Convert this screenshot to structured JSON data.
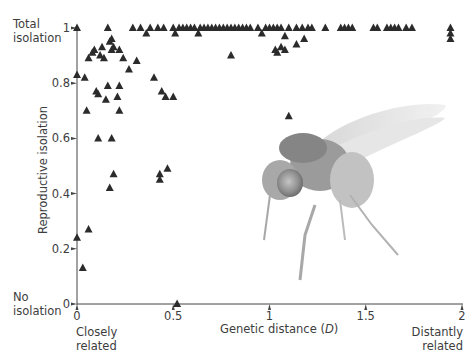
{
  "chart_data": {
    "type": "scatter",
    "title": "",
    "xlabel": "Genetic distance (D)",
    "ylabel": "Reproductive isolation",
    "xlim": [
      0,
      2
    ],
    "ylim": [
      0,
      1
    ],
    "x_ticks": [
      "0",
      "0.5",
      "1",
      "1.5",
      "2"
    ],
    "y_ticks": [
      "0",
      "0.2",
      "0.4",
      "0.6",
      "0.8",
      "1"
    ],
    "grid": false,
    "legend": null,
    "marker": "triangle",
    "marker_color": "#2b2b2b",
    "annotations": {
      "y_top": "Total isolation",
      "y_bottom": "No isolation",
      "x_left": "Closely related",
      "x_right": "Distantly related"
    },
    "points": [
      {
        "x": 0.0,
        "y": 1.0
      },
      {
        "x": 0.0,
        "y": 0.83
      },
      {
        "x": 0.04,
        "y": 0.82
      },
      {
        "x": 0.0,
        "y": 0.24
      },
      {
        "x": 0.03,
        "y": 0.13
      },
      {
        "x": 0.06,
        "y": 0.27
      },
      {
        "x": 0.16,
        "y": 1.0
      },
      {
        "x": 0.29,
        "y": 1.0
      },
      {
        "x": 0.33,
        "y": 1.0
      },
      {
        "x": 0.36,
        "y": 0.98
      },
      {
        "x": 0.06,
        "y": 0.89
      },
      {
        "x": 0.08,
        "y": 0.91
      },
      {
        "x": 0.09,
        "y": 0.92
      },
      {
        "x": 0.12,
        "y": 0.9
      },
      {
        "x": 0.13,
        "y": 0.93
      },
      {
        "x": 0.14,
        "y": 0.89
      },
      {
        "x": 0.17,
        "y": 0.95
      },
      {
        "x": 0.18,
        "y": 0.96
      },
      {
        "x": 0.18,
        "y": 0.92
      },
      {
        "x": 0.19,
        "y": 0.93
      },
      {
        "x": 0.22,
        "y": 0.92
      },
      {
        "x": 0.24,
        "y": 0.89
      },
      {
        "x": 0.31,
        "y": 0.88
      },
      {
        "x": 0.27,
        "y": 0.85
      },
      {
        "x": 0.1,
        "y": 0.77
      },
      {
        "x": 0.11,
        "y": 0.76
      },
      {
        "x": 0.16,
        "y": 0.79
      },
      {
        "x": 0.15,
        "y": 0.74
      },
      {
        "x": 0.21,
        "y": 0.75
      },
      {
        "x": 0.22,
        "y": 0.79
      },
      {
        "x": 0.05,
        "y": 0.7
      },
      {
        "x": 0.22,
        "y": 0.7
      },
      {
        "x": 0.11,
        "y": 0.6
      },
      {
        "x": 0.18,
        "y": 0.6
      },
      {
        "x": 0.19,
        "y": 0.47
      },
      {
        "x": 0.17,
        "y": 0.42
      },
      {
        "x": 0.4,
        "y": 0.82
      },
      {
        "x": 0.44,
        "y": 0.77
      },
      {
        "x": 0.46,
        "y": 0.75
      },
      {
        "x": 0.5,
        "y": 0.75
      },
      {
        "x": 0.43,
        "y": 0.47
      },
      {
        "x": 0.43,
        "y": 0.45
      },
      {
        "x": 0.47,
        "y": 0.49
      },
      {
        "x": 0.52,
        "y": 0.0
      },
      {
        "x": 0.38,
        "y": 1.0
      },
      {
        "x": 0.42,
        "y": 1.0
      },
      {
        "x": 0.45,
        "y": 1.0
      },
      {
        "x": 0.5,
        "y": 1.0
      },
      {
        "x": 0.51,
        "y": 0.98
      },
      {
        "x": 0.53,
        "y": 1.0
      },
      {
        "x": 0.55,
        "y": 1.0
      },
      {
        "x": 0.57,
        "y": 1.0
      },
      {
        "x": 0.59,
        "y": 1.0
      },
      {
        "x": 0.61,
        "y": 1.0
      },
      {
        "x": 0.63,
        "y": 0.98
      },
      {
        "x": 0.64,
        "y": 1.0
      },
      {
        "x": 0.66,
        "y": 1.0
      },
      {
        "x": 0.68,
        "y": 1.0
      },
      {
        "x": 0.7,
        "y": 1.0
      },
      {
        "x": 0.72,
        "y": 1.0
      },
      {
        "x": 0.74,
        "y": 1.0
      },
      {
        "x": 0.76,
        "y": 1.0
      },
      {
        "x": 0.78,
        "y": 1.0
      },
      {
        "x": 0.8,
        "y": 1.0
      },
      {
        "x": 0.82,
        "y": 1.0
      },
      {
        "x": 0.84,
        "y": 1.0
      },
      {
        "x": 0.86,
        "y": 1.0
      },
      {
        "x": 0.88,
        "y": 1.0
      },
      {
        "x": 0.9,
        "y": 1.0
      },
      {
        "x": 0.8,
        "y": 0.9
      },
      {
        "x": 0.94,
        "y": 1.0
      },
      {
        "x": 0.96,
        "y": 0.98
      },
      {
        "x": 0.98,
        "y": 1.0
      },
      {
        "x": 1.0,
        "y": 1.0
      },
      {
        "x": 1.02,
        "y": 1.0
      },
      {
        "x": 1.04,
        "y": 1.0
      },
      {
        "x": 1.06,
        "y": 1.0
      },
      {
        "x": 1.08,
        "y": 0.97
      },
      {
        "x": 1.1,
        "y": 1.0
      },
      {
        "x": 1.14,
        "y": 1.0
      },
      {
        "x": 1.17,
        "y": 1.0
      },
      {
        "x": 1.2,
        "y": 1.0
      },
      {
        "x": 1.22,
        "y": 1.0
      },
      {
        "x": 1.29,
        "y": 1.0
      },
      {
        "x": 1.18,
        "y": 0.96
      },
      {
        "x": 1.14,
        "y": 0.94
      },
      {
        "x": 1.06,
        "y": 0.93
      },
      {
        "x": 1.08,
        "y": 0.92
      },
      {
        "x": 1.04,
        "y": 0.91
      },
      {
        "x": 1.03,
        "y": 0.92
      },
      {
        "x": 1.1,
        "y": 0.68
      },
      {
        "x": 1.37,
        "y": 1.0
      },
      {
        "x": 1.39,
        "y": 1.0
      },
      {
        "x": 1.41,
        "y": 1.0
      },
      {
        "x": 1.43,
        "y": 1.0
      },
      {
        "x": 1.54,
        "y": 1.0
      },
      {
        "x": 1.56,
        "y": 1.0
      },
      {
        "x": 1.61,
        "y": 1.0
      },
      {
        "x": 1.63,
        "y": 1.0
      },
      {
        "x": 1.65,
        "y": 1.0
      },
      {
        "x": 1.67,
        "y": 1.0
      },
      {
        "x": 1.71,
        "y": 1.0
      },
      {
        "x": 1.74,
        "y": 1.0
      },
      {
        "x": 1.94,
        "y": 1.0
      },
      {
        "x": 1.94,
        "y": 0.98
      },
      {
        "x": 1.94,
        "y": 0.96
      }
    ]
  },
  "labels": {
    "y_top_line1": "Total",
    "y_top_line2": "isolation",
    "y_bottom_line1": "No",
    "y_bottom_line2": "isolation",
    "x_left_line1": "Closely",
    "x_left_line2": "related",
    "x_right_line1": "Distantly",
    "x_right_line2": "related",
    "xlabel_prefix": "Genetic distance (",
    "xlabel_var": "D",
    "xlabel_suffix": ")",
    "ylabel": "Reproductive isolation"
  },
  "ticks": {
    "y": [
      {
        "label": "1",
        "value": 1
      },
      {
        "label": "0.8",
        "value": 0.8
      },
      {
        "label": "0.6",
        "value": 0.6
      },
      {
        "label": "0.4",
        "value": 0.4
      },
      {
        "label": "0.2",
        "value": 0.2
      },
      {
        "label": "0",
        "value": 0
      }
    ],
    "x": [
      {
        "label": "0",
        "value": 0
      },
      {
        "label": "0.5",
        "value": 0.5
      },
      {
        "label": "1",
        "value": 1
      },
      {
        "label": "1.5",
        "value": 1.5
      },
      {
        "label": "2",
        "value": 2
      }
    ]
  },
  "image": {
    "subject": "fruit-fly-photo"
  }
}
